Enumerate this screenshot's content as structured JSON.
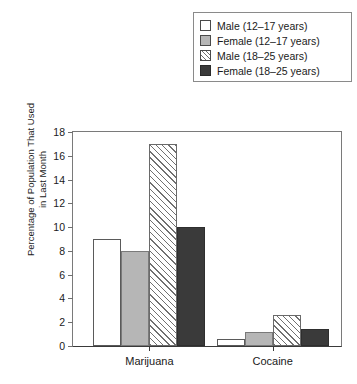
{
  "chart_data": {
    "type": "bar",
    "title": "",
    "xlabel": "",
    "ylabel_line1": "Percentage of Population That Used",
    "ylabel_line2": "in Last Month",
    "categories": [
      "Marijuana",
      "Cocaine"
    ],
    "ylim": [
      0,
      18
    ],
    "yticks": [
      0,
      2,
      4,
      6,
      8,
      10,
      12,
      14,
      16,
      18
    ],
    "ytick_labels": [
      "0",
      "2",
      "4",
      "6",
      "8",
      "10",
      "12",
      "14",
      "16",
      "18"
    ],
    "grid": false,
    "legend_position": "top-right",
    "series": [
      {
        "name": "Male (12–17 years)",
        "fill": "white",
        "color": "#ffffff",
        "values": [
          9,
          0.6
        ]
      },
      {
        "name": "Female (12–17 years)",
        "fill": "gray",
        "color": "#b6b6b6",
        "values": [
          8,
          1.2
        ]
      },
      {
        "name": "Male (18–25 years)",
        "fill": "hatch",
        "color": "#707070",
        "values": [
          17,
          2.6
        ]
      },
      {
        "name": "Female (18–25 years)",
        "fill": "dark",
        "color": "#3a3a3a",
        "values": [
          10,
          1.4
        ]
      }
    ]
  }
}
